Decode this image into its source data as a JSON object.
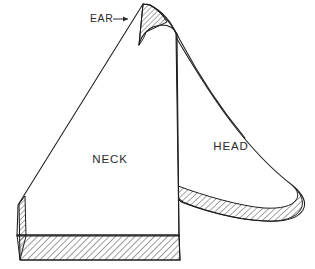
{
  "figure": {
    "background_color": "#ffffff",
    "line_color": "#1d1d1d",
    "text_color": "#2b2b2b",
    "width": 315,
    "height": 269
  },
  "labels": {
    "neck": "NECK",
    "head": "HEAD",
    "ear": "EAR",
    "ear_arrow": "→",
    "ear_callout": "EAR→"
  },
  "regions": [
    {
      "name": "neck",
      "label": "NECK",
      "label_x": 110,
      "label_y": 160,
      "shading": "none",
      "edge_shading": "hatched"
    },
    {
      "name": "head",
      "label": "HEAD",
      "label_x": 231,
      "label_y": 147,
      "shading": "none",
      "edge_shading": "hatched"
    },
    {
      "name": "ear",
      "label": "EAR",
      "label_x": 104,
      "label_y": 19,
      "shading": "hatched",
      "edge_shading": "hatched"
    }
  ],
  "callouts": [
    {
      "name": "ear-callout",
      "text": "EAR→",
      "points_to": "ear",
      "x": 104,
      "y": 19
    }
  ],
  "hatch": {
    "angle_degrees": 45,
    "spacing_px": 3.2,
    "stroke_width": 0.6,
    "color": "#1d1d1d"
  }
}
